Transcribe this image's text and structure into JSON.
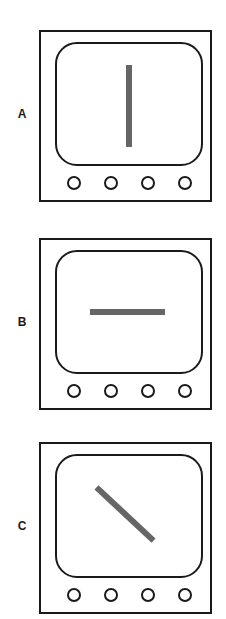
{
  "figure": {
    "background_color": "#ffffff",
    "line_color": "#1a1a1a",
    "bar_color": "#666666",
    "panels": [
      {
        "label": "A",
        "orientation": "vertical",
        "orientation_degrees": 90,
        "button_count": 4,
        "buttons": [
          "button-1",
          "button-2",
          "button-3",
          "button-4"
        ]
      },
      {
        "label": "B",
        "orientation": "horizontal",
        "orientation_degrees": 0,
        "button_count": 4,
        "buttons": [
          "button-1",
          "button-2",
          "button-3",
          "button-4"
        ]
      },
      {
        "label": "C",
        "orientation": "diagonal",
        "orientation_degrees": -43,
        "button_count": 4,
        "buttons": [
          "button-1",
          "button-2",
          "button-3",
          "button-4"
        ]
      }
    ]
  }
}
